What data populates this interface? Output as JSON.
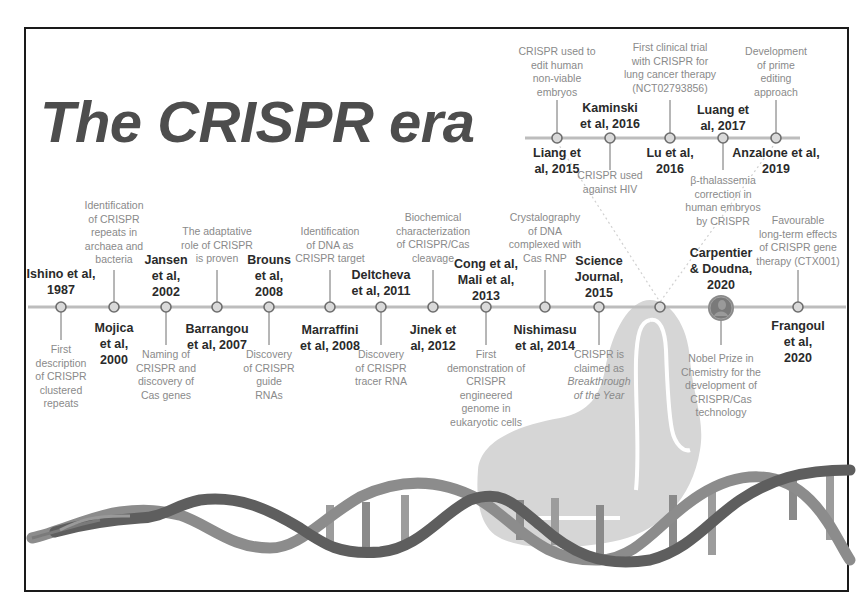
{
  "title": "The CRISPR era",
  "colors": {
    "timeline": "#bdbdbd",
    "node_fill": "#d9d9d9",
    "node_stroke": "#6e6e6e",
    "title": "#4d4d4d",
    "bold_text": "#2a2a2a",
    "desc_text": "#8a8a8a",
    "dna_dark": "#5e5e5e",
    "dna_light": "#8c8c8c",
    "cas9": "#d6d6d6",
    "frame": "#1a1a1a"
  },
  "main_timeline": {
    "events": [
      {
        "name": "Ishino et al, 1987",
        "name_lines": [
          "Ishino et al,",
          "1987"
        ],
        "name_pos": "above",
        "desc_lines": [
          "First",
          "description",
          "of CRISPR",
          "clustered",
          "repeats"
        ],
        "desc_pos": "below",
        "x": 61
      },
      {
        "name": "Mojica et al, 2000",
        "name_lines": [
          "Mojica",
          "et al,",
          "2000"
        ],
        "name_pos": "below",
        "desc_lines": [
          "Identification",
          "of CRISPR",
          "repeats in",
          "archaea and",
          "bacteria"
        ],
        "desc_pos": "above",
        "x": 114
      },
      {
        "name": "Jansen et al, 2002",
        "name_lines": [
          "Jansen",
          "et al,",
          "2002"
        ],
        "name_pos": "above",
        "desc_lines": [
          "Naming of",
          "CRISPR and",
          "discovery of",
          "Cas genes"
        ],
        "desc_pos": "below",
        "x": 166
      },
      {
        "name": "Barrangou et al, 2007",
        "name_lines": [
          "Barrangou",
          "et al, 2007"
        ],
        "name_pos": "below",
        "desc_lines": [
          "The adaptative",
          "role of CRISPR",
          "is proven"
        ],
        "desc_pos": "above",
        "x": 217
      },
      {
        "name": "Brouns et al, 2008",
        "name_lines": [
          "Brouns",
          "et al,",
          "2008"
        ],
        "name_pos": "above",
        "desc_lines": [
          "Discovery",
          "of CRISPR",
          "guide",
          "RNAs"
        ],
        "desc_pos": "below",
        "x": 269
      },
      {
        "name": "Marraffini et al, 2008",
        "name_lines": [
          "Marraffini",
          "et al, 2008"
        ],
        "name_pos": "below",
        "desc_lines": [
          "Identification",
          "of DNA as",
          "CRISPR target"
        ],
        "desc_pos": "above",
        "x": 330
      },
      {
        "name": "Deltcheva et al, 2011",
        "name_lines": [
          "Deltcheva",
          "et al, 2011"
        ],
        "name_pos": "above",
        "desc_lines": [
          "Discovery",
          "of CRISPR",
          "tracer RNA"
        ],
        "desc_pos": "below",
        "x": 381
      },
      {
        "name": "Jinek et al, 2012",
        "name_lines": [
          "Jinek et",
          "al, 2012"
        ],
        "name_pos": "below",
        "desc_lines": [
          "Biochemical",
          "characterization",
          "of CRISPR/Cas",
          "cleavage"
        ],
        "desc_pos": "above",
        "x": 433
      },
      {
        "name": "Cong et al, Mali et al, 2013",
        "name_lines": [
          "Cong et al,",
          "Mali et al,",
          "2013"
        ],
        "name_pos": "above",
        "desc_lines": [
          "First",
          "demonstration of",
          "CRISPR",
          "engineered",
          "genome in",
          "eukaryotic cells"
        ],
        "desc_pos": "below",
        "x": 486
      },
      {
        "name": "Nishimasu et al, 2014",
        "name_lines": [
          "Nishimasu",
          "et al, 2014"
        ],
        "name_pos": "below",
        "desc_lines": [
          "Crystalography",
          "of DNA",
          "complexed with",
          "Cas RNP"
        ],
        "desc_pos": "above",
        "x": 545
      },
      {
        "name": "Science Journal, 2015",
        "name_lines": [
          "Science",
          "Journal,",
          "2015"
        ],
        "name_pos": "above",
        "desc_lines": [
          "CRISPR is",
          "claimed as",
          "Breakthrough",
          "of the Year"
        ],
        "desc_italic_from": 2,
        "desc_pos": "below",
        "x": 599
      },
      {
        "name": "",
        "name_lines": [],
        "name_pos": "none",
        "desc_lines": [],
        "desc_pos": "none",
        "x": 660,
        "is_branch_point": true
      },
      {
        "name": "Carpentier & Doudna, 2020",
        "name_lines": [
          "Carpentier",
          "& Doudna,",
          "2020"
        ],
        "name_pos": "above",
        "desc_lines": [
          "Nobel Prize in",
          "Chemistry for the",
          "development of",
          "CRISPR/Cas",
          "technology"
        ],
        "desc_pos": "below",
        "x": 721,
        "icon": "nobel-medal-icon"
      },
      {
        "name": "Frangoul et al, 2020",
        "name_lines": [
          "Frangoul",
          "et al,",
          "2020"
        ],
        "name_pos": "below",
        "desc_lines": [
          "Favourable",
          "long-term effects",
          "of CRISPR gene",
          "therapy (CTX001)"
        ],
        "desc_pos": "above",
        "x": 798
      }
    ]
  },
  "branch_timeline": {
    "events": [
      {
        "name": "Liang et al, 2015",
        "name_lines": [
          "Liang et",
          "al, 2015"
        ],
        "name_pos": "below",
        "desc_lines": [
          "CRISPR used to",
          "edit human",
          "non-viable",
          "embryos"
        ],
        "desc_pos": "above",
        "x": 557
      },
      {
        "name": "Kaminski et al, 2016",
        "name_lines": [
          "Kaminski",
          "et al, 2016"
        ],
        "name_pos": "above",
        "desc_lines": [
          "CRISPR used",
          "against HIV"
        ],
        "desc_pos": "below",
        "x": 610
      },
      {
        "name": "Lu et al, 2016",
        "name_lines": [
          "Lu et al,",
          "2016"
        ],
        "name_pos": "below",
        "desc_lines": [
          "First clinical trial",
          "with CRISPR for",
          "lung cancer therapy",
          "(NCT02793856)"
        ],
        "desc_pos": "above",
        "x": 670
      },
      {
        "name": "Luang et al, 2017",
        "name_lines": [
          "Luang et",
          "al, 2017"
        ],
        "name_pos": "above",
        "desc_lines": [
          "β-thalassemia",
          "correction in",
          "human embryos",
          "by CRISPR"
        ],
        "desc_pos": "below",
        "x": 723
      },
      {
        "name": "Anzalone et al, 2019",
        "name_lines": [
          "Anzalone et al,",
          "2019"
        ],
        "name_pos": "below",
        "desc_lines": [
          "Development",
          "of prime",
          "editing",
          "approach"
        ],
        "desc_pos": "above",
        "x": 776
      }
    ]
  }
}
